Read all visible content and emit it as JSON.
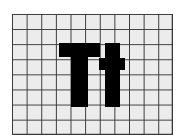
{
  "icon": {
    "name": "text-size-icon",
    "glyph_text": "Tt",
    "grid": {
      "columns": 11,
      "rows": 8,
      "cell_color": "#ececec",
      "line_color": "#3a3a3a"
    },
    "glyph_color": "#000000",
    "background_color": "#ffffff"
  }
}
